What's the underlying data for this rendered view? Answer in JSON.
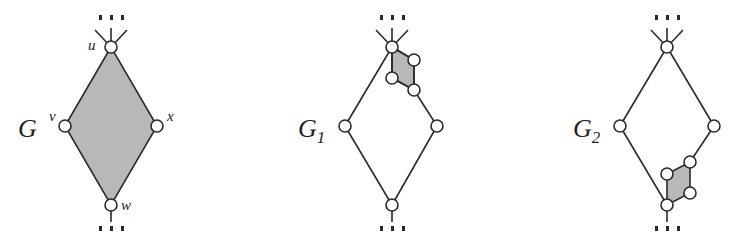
{
  "figure": {
    "panels": [
      {
        "id": "G",
        "label": "G",
        "subscript": "",
        "vertex_labels": {
          "u": "u",
          "v": "v",
          "x": "x",
          "w": "w"
        },
        "shaded_region": "whole diamond u-v-w-x",
        "description": "Diamond graph with vertices u (top), v (left), x (right), w (bottom); interior shaded gray; ellipsis edges above u and below w"
      },
      {
        "id": "G1",
        "label": "G",
        "subscript": "1",
        "shaded_region": "small quadrilateral attached at top vertex",
        "description": "Unshaded diamond with a small shaded 4-vertex gadget near the top vertex on the right edge"
      },
      {
        "id": "G2",
        "label": "G",
        "subscript": "2",
        "shaded_region": "small quadrilateral attached at bottom vertex",
        "description": "Unshaded diamond with a small shaded 4-vertex gadget near the bottom vertex on the right edge"
      }
    ],
    "ellipsis": "⋮",
    "colors": {
      "stroke": "#2a2a2a",
      "shade": "#b8b8b8",
      "node_fill": "#ffffff",
      "background": "#ffffff"
    }
  }
}
